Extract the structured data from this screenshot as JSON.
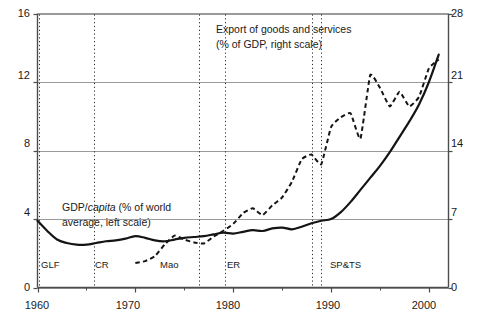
{
  "chart_data": {
    "type": "line",
    "title": "",
    "xlabel": "",
    "ylabel": "",
    "xlim": [
      1960,
      2002
    ],
    "grid": true,
    "legend_position": "inline-annotations",
    "axes": {
      "left": {
        "label": "GDP/capita (% of world average, left scale)",
        "ticks": [
          0,
          4,
          8,
          12,
          16
        ],
        "lim": [
          0,
          16
        ]
      },
      "right": {
        "label": "Export of goods and services (% of GDP, right scale)",
        "ticks": [
          0,
          7,
          14,
          21,
          28
        ],
        "lim": [
          0,
          28
        ]
      },
      "bottom": {
        "ticks": [
          1960,
          1970,
          1980,
          1990,
          2000
        ],
        "minor_ticks": [
          1965,
          1975,
          1985,
          1995
        ]
      }
    },
    "series": [
      {
        "name": "GDP/capita (% of world average, left scale)",
        "axis": "left",
        "style": "solid",
        "color": "#141414",
        "x": [
          1960,
          1961,
          1962,
          1963,
          1964,
          1965,
          1966,
          1967,
          1968,
          1969,
          1970,
          1971,
          1972,
          1973,
          1974,
          1975,
          1976,
          1977,
          1978,
          1979,
          1980,
          1981,
          1982,
          1983,
          1984,
          1985,
          1986,
          1987,
          1988,
          1989,
          1990,
          1991,
          1992,
          1993,
          1994,
          1995,
          1996,
          1997,
          1998,
          1999,
          2000,
          2001
        ],
        "y": [
          3.9,
          3.3,
          2.8,
          2.6,
          2.5,
          2.5,
          2.6,
          2.7,
          2.75,
          2.85,
          3.0,
          2.9,
          2.75,
          2.7,
          2.8,
          2.9,
          2.95,
          3.0,
          3.1,
          3.2,
          3.15,
          3.25,
          3.35,
          3.3,
          3.45,
          3.5,
          3.4,
          3.55,
          3.75,
          3.9,
          4.0,
          4.4,
          5.0,
          5.7,
          6.4,
          7.1,
          7.9,
          8.8,
          9.7,
          10.7,
          12.0,
          13.6
        ]
      },
      {
        "name": "Export of goods and services (% of GDP, right scale)",
        "axis": "right",
        "style": "dashed",
        "color": "#141414",
        "x": [
          1970,
          1971,
          1972,
          1973,
          1974,
          1975,
          1976,
          1977,
          1978,
          1979,
          1980,
          1981,
          1982,
          1983,
          1984,
          1985,
          1986,
          1987,
          1988,
          1989,
          1990,
          1991,
          1992,
          1993,
          1994,
          1995,
          1996,
          1997,
          1998,
          1999,
          2000,
          2001
        ],
        "y": [
          2.5,
          2.7,
          3.2,
          4.4,
          5.3,
          4.9,
          4.6,
          4.5,
          5.2,
          5.8,
          6.5,
          7.6,
          8.1,
          7.4,
          8.4,
          9.2,
          10.8,
          13.1,
          13.6,
          12.6,
          16.4,
          17.4,
          17.8,
          15.2,
          21.7,
          20.4,
          18.5,
          20.0,
          18.5,
          19.5,
          22.4,
          23.3
        ]
      }
    ],
    "event_markers": [
      {
        "id": "glf",
        "label": "GLF",
        "year": 1960.2,
        "lines": [
          1960.2
        ]
      },
      {
        "id": "cr",
        "label": "CR",
        "year": 1965.8,
        "lines": [
          1965.8
        ]
      },
      {
        "id": "mao",
        "label": "Mao",
        "year": 1972.5,
        "lines": [
          1976.5
        ]
      },
      {
        "id": "er",
        "label": "ER",
        "year": 1979.2,
        "lines": [
          1979.2
        ]
      },
      {
        "id": "sp-ts",
        "label": "SP&TS",
        "year": 1989.2,
        "lines": [
          1988.0,
          1989.0
        ]
      }
    ],
    "annotations": [
      {
        "id": "export-annotation",
        "line1": "Export of goods and services",
        "line2": "(% of GDP, right scale)"
      },
      {
        "id": "gdp-annotation",
        "line1_a": "GDP/",
        "line1_italic": "capita",
        "line1_b": " (% of world",
        "line2": "average, left scale)"
      }
    ],
    "colors": {
      "axis": "#4d4d4d",
      "grid": "#9a9a9a",
      "line": "#141414",
      "text": "#1a1a1a",
      "background": "#ffffff"
    }
  }
}
